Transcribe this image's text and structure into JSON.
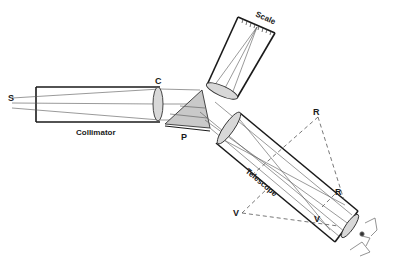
{
  "diagram": {
    "type": "spectroscope",
    "labels": {
      "source": "S",
      "collimator_lens": "C",
      "collimator": "Collimator",
      "prism": "P",
      "scale": "Scale",
      "telescope": "Telescope",
      "red_image": "R",
      "red_virtual": "R",
      "violet_image": "V",
      "violet_virtual": "V"
    },
    "colors": {
      "line": "#1a1a1a",
      "ray": "#555555",
      "glass_fill": "#d8d8d8",
      "prism_fill": "#c9c9c9"
    }
  }
}
